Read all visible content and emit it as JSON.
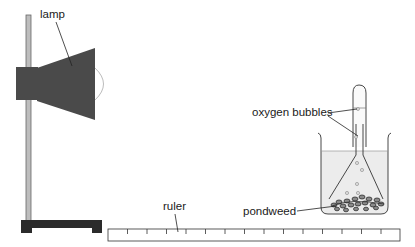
{
  "diagram": {
    "labels": {
      "lamp": "lamp",
      "oxygen_bubbles": "oxygen bubbles",
      "ruler": "ruler",
      "pondweed": "pondweed"
    },
    "components": [
      "retort-stand",
      "lamp",
      "ruler",
      "beaker",
      "funnel",
      "test-tube",
      "pondweed",
      "oxygen-bubbles"
    ],
    "ruler": {
      "tick_count": 14
    },
    "colors": {
      "lamp_body": "#4a4a4a",
      "stand_base": "#2b2b2b",
      "rod": "#b8b8b8",
      "water": "#ededed",
      "outline": "#333333"
    }
  }
}
